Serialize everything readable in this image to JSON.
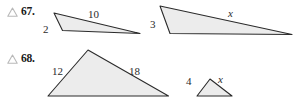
{
  "page": {
    "background": "#ffffff",
    "width": 303,
    "height": 105
  },
  "style": {
    "triangle_fill": "#ececec",
    "triangle_stroke": "#2b2b2b",
    "bullet_color": "#b9b9b9",
    "text_color": "#1a1a1a"
  },
  "exercises": [
    {
      "number": "67.",
      "bullet_icon": "triangle-outline-icon",
      "figures": [
        {
          "name": "small-triangle",
          "labels": [
            {
              "text": "2",
              "kind": "number"
            },
            {
              "text": "10",
              "kind": "number"
            }
          ]
        },
        {
          "name": "large-triangle",
          "labels": [
            {
              "text": "3",
              "kind": "number"
            },
            {
              "text": "x",
              "kind": "variable"
            }
          ]
        }
      ]
    },
    {
      "number": "68.",
      "bullet_icon": "triangle-outline-icon",
      "figures": [
        {
          "name": "large-triangle",
          "labels": [
            {
              "text": "12",
              "kind": "number"
            },
            {
              "text": "18",
              "kind": "number"
            }
          ]
        },
        {
          "name": "small-triangle",
          "labels": [
            {
              "text": "4",
              "kind": "number"
            },
            {
              "text": "x",
              "kind": "variable"
            }
          ]
        }
      ]
    }
  ]
}
